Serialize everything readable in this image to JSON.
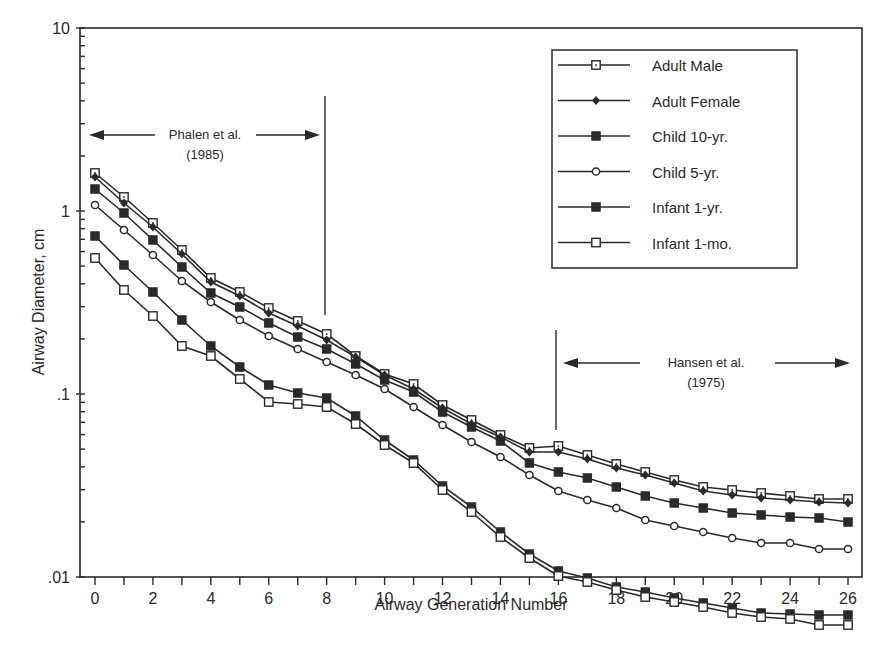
{
  "chart_data": {
    "type": "line",
    "title": "",
    "xlabel": "Airway Generation Number",
    "ylabel": "Airway Diameter, cm",
    "yscale": "log",
    "ylim": [
      0.01,
      10
    ],
    "xlim": [
      0,
      26
    ],
    "x": [
      0,
      1,
      2,
      3,
      4,
      5,
      6,
      7,
      8,
      9,
      10,
      11,
      12,
      13,
      14,
      15,
      16,
      17,
      18,
      19,
      20,
      21,
      22,
      23,
      24,
      25,
      26
    ],
    "x_tick_labels": [
      "0",
      "2",
      "4",
      "6",
      "8",
      "10",
      "12",
      "14",
      "16",
      "18",
      "20",
      "22",
      "24",
      "26"
    ],
    "y_tick_labels": [
      ".01",
      ".1",
      "1",
      "10"
    ],
    "grid": false,
    "legend_position": "upper right",
    "series": [
      {
        "name": "Adult Male",
        "marker": "open-square-dot",
        "values": [
          1.61,
          1.19,
          0.86,
          0.61,
          0.43,
          0.36,
          0.3,
          0.25,
          0.21,
          0.16,
          0.13,
          0.114,
          0.088,
          0.073,
          0.06,
          0.051,
          0.052,
          0.046,
          0.041,
          0.037,
          0.034,
          0.031,
          0.03,
          0.029,
          0.028,
          0.027,
          0.027
        ]
      },
      {
        "name": "Adult Female",
        "marker": "filled-diamond",
        "values": [
          1.53,
          1.11,
          0.82,
          0.58,
          0.41,
          0.34,
          0.28,
          0.24,
          0.2,
          0.16,
          0.13,
          0.107,
          0.084,
          0.069,
          0.058,
          0.048,
          0.048,
          0.044,
          0.039,
          0.036,
          0.033,
          0.03,
          0.028,
          0.027,
          0.026,
          0.025,
          0.025
        ]
      },
      {
        "name": "Child 10-yr.",
        "marker": "filled-square",
        "values": [
          1.32,
          0.97,
          0.7,
          0.5,
          0.36,
          0.3,
          0.25,
          0.21,
          0.18,
          0.15,
          0.12,
          0.103,
          0.08,
          0.066,
          0.055,
          0.043,
          0.038,
          0.035,
          0.031,
          0.028,
          0.026,
          0.024,
          0.023,
          0.022,
          0.022,
          0.021,
          0.02
        ]
      },
      {
        "name": "Child 5-yr.",
        "marker": "open-circle",
        "values": [
          1.08,
          0.79,
          0.58,
          0.42,
          0.32,
          0.26,
          0.21,
          0.18,
          0.15,
          0.13,
          0.11,
          0.088,
          0.07,
          0.057,
          0.047,
          0.037,
          0.029,
          0.026,
          0.024,
          0.021,
          0.02,
          0.019,
          0.018,
          0.017,
          0.017,
          0.016,
          0.016
        ]
      },
      {
        "name": "Infant 1-yr.",
        "marker": "filled-square",
        "values": [
          0.73,
          0.53,
          0.38,
          0.27,
          0.2,
          0.15,
          0.12,
          0.11,
          0.104,
          0.083,
          0.061,
          0.048,
          0.034,
          0.026,
          0.019,
          0.015,
          0.0122,
          0.011,
          0.0098,
          0.0092,
          0.0085,
          0.008,
          0.0075,
          0.007,
          0.0069,
          0.0068,
          0.0068
        ]
      },
      {
        "name": "Infant 1-mo.",
        "marker": "open-square",
        "values": [
          0.55,
          0.37,
          0.27,
          0.19,
          0.17,
          0.13,
          0.096,
          0.094,
          0.091,
          0.073,
          0.056,
          0.045,
          0.032,
          0.024,
          0.018,
          0.014,
          0.011,
          0.0102,
          0.0093,
          0.0085,
          0.008,
          0.0075,
          0.007,
          0.0066,
          0.0064,
          0.006,
          0.006
        ]
      }
    ],
    "annotations": [
      {
        "text_line1": "Phalen et al.",
        "text_line2": "(1985)",
        "range": [
          0,
          8
        ],
        "divider_at": 8
      },
      {
        "text_line1": "Hansen et al.",
        "text_line2": "(1975)",
        "range": [
          16,
          26
        ],
        "divider_at": 16
      }
    ]
  },
  "pixel_series": [
    [
      173,
      197,
      223,
      250,
      278,
      292,
      308,
      321,
      334,
      356,
      374,
      384,
      405,
      420,
      435,
      448,
      446,
      455,
      464,
      472,
      480,
      487,
      490,
      493,
      496,
      499,
      499
    ],
    [
      177,
      203,
      227,
      254,
      282,
      296,
      313,
      326,
      340,
      357,
      375,
      389,
      408,
      424,
      437,
      452,
      452,
      459,
      468,
      475,
      483,
      491,
      495,
      498,
      500,
      502,
      503
    ],
    [
      189,
      213,
      240,
      267,
      293,
      307,
      323,
      337,
      349,
      364,
      380,
      392,
      412,
      427,
      441,
      463,
      472,
      478,
      487,
      496,
      503,
      508,
      513,
      515,
      517,
      518,
      522
    ],
    [
      205,
      230,
      255,
      281,
      302,
      320,
      336,
      349,
      362,
      375,
      389,
      407,
      425,
      442,
      457,
      475,
      491,
      500,
      508,
      520,
      526,
      532,
      538,
      543,
      543,
      549,
      549
    ],
    [
      236,
      265,
      292,
      320,
      346,
      367,
      385,
      393,
      398,
      416,
      440,
      460,
      486,
      507,
      532,
      554,
      571,
      578,
      587,
      592,
      598,
      603,
      608,
      613,
      614,
      615,
      615
    ],
    [
      258,
      290,
      316,
      346,
      356,
      379,
      402,
      404,
      407,
      424,
      445,
      463,
      490,
      512,
      537,
      558,
      576,
      582,
      590,
      597,
      602,
      607,
      613,
      617,
      619,
      625,
      625
    ]
  ]
}
